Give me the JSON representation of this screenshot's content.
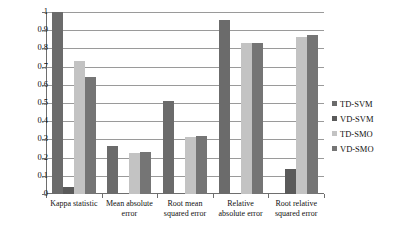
{
  "chart_data": {
    "type": "bar",
    "title": "",
    "subtitle": "",
    "xlabel": "",
    "ylabel": "",
    "ylim": [
      0,
      1
    ],
    "ytick_values": [
      1,
      0.9,
      0.8,
      0.7,
      0.6,
      0.5,
      0.4,
      0.3,
      0.2,
      0.1,
      0
    ],
    "ytick_labels": [
      "1",
      "0.9",
      "0.8",
      "0.7",
      "0.6",
      "0.5",
      "0.4",
      "0.3",
      "0.2",
      "0.1",
      "0"
    ],
    "grid": true,
    "legend_position": "right",
    "categories": [
      "Kappa statistic",
      "Mean absolute error",
      "Root mean squared error",
      "Relative absolute error",
      "Root relative squared error"
    ],
    "series": [
      {
        "name": "TD-SVM",
        "color": "#6b6b6b",
        "values": [
          1.0,
          0.265,
          0.513,
          0.955,
          0.0
        ]
      },
      {
        "name": "VD-SVM",
        "color": "#5a5a5a",
        "values": [
          0.04,
          0.0,
          0.0,
          0.0,
          0.135
        ]
      },
      {
        "name": "TD-SMO",
        "color": "#c3c3c3",
        "values": [
          0.732,
          0.227,
          0.315,
          0.832,
          0.862
        ]
      },
      {
        "name": "VD-SMO",
        "color": "#757575",
        "values": [
          0.645,
          0.231,
          0.32,
          0.828,
          0.873
        ]
      }
    ]
  },
  "legend": {
    "items": [
      {
        "label": "TD-SVM"
      },
      {
        "label": "VD-SVM"
      },
      {
        "label": "TD-SMO"
      },
      {
        "label": "VD-SMO"
      }
    ]
  }
}
